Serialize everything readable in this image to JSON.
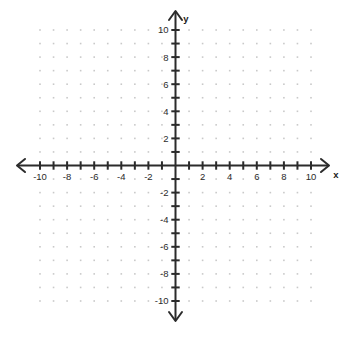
{
  "figure": {
    "background_color": "#ffffff",
    "axis_color": "#2b2b2b",
    "grid_dot_color": "#c9c9c9",
    "x_axis_name": "x",
    "y_axis_name": "y"
  },
  "chart_data": {
    "type": "scatter",
    "title": "",
    "subtitle": "",
    "xlabel": "x",
    "ylabel": "y",
    "xlim": [
      -11,
      11
    ],
    "ylim": [
      -11,
      11
    ],
    "grid": true,
    "grid_style": "dotted-lattice",
    "grid_spacing": 1,
    "legend": null,
    "series": [],
    "x": [],
    "y": [],
    "annotations": [],
    "x_tick_values": [
      -10,
      -9,
      -8,
      -7,
      -6,
      -5,
      -4,
      -3,
      -2,
      -1,
      0,
      1,
      2,
      3,
      4,
      5,
      6,
      7,
      8,
      9,
      10
    ],
    "y_tick_values": [
      -10,
      -9,
      -8,
      -7,
      -6,
      -5,
      -4,
      -3,
      -2,
      -1,
      0,
      1,
      2,
      3,
      4,
      5,
      6,
      7,
      8,
      9,
      10
    ],
    "x_labeled_ticks": [
      {
        "value": -10,
        "label": "-10"
      },
      {
        "value": -8,
        "label": "-8"
      },
      {
        "value": -6,
        "label": "-6"
      },
      {
        "value": -4,
        "label": "-4"
      },
      {
        "value": -2,
        "label": "-2"
      },
      {
        "value": 2,
        "label": "2"
      },
      {
        "value": 4,
        "label": "4"
      },
      {
        "value": 6,
        "label": "6"
      },
      {
        "value": 8,
        "label": "8"
      },
      {
        "value": 10,
        "label": "10"
      }
    ],
    "y_labeled_ticks": [
      {
        "value": 10,
        "label": "10"
      },
      {
        "value": 8,
        "label": "8"
      },
      {
        "value": 6,
        "label": "6"
      },
      {
        "value": 4,
        "label": "4"
      },
      {
        "value": 2,
        "label": "2"
      },
      {
        "value": -2,
        "label": "-2"
      },
      {
        "value": -4,
        "label": "-4"
      },
      {
        "value": -6,
        "label": "-6"
      },
      {
        "value": -8,
        "label": "-8"
      },
      {
        "value": -10,
        "label": "-10"
      }
    ]
  }
}
